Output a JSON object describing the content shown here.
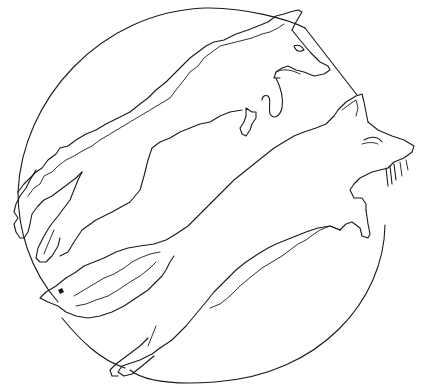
{
  "image": {
    "title": "Two foxes leaping inside a circle",
    "style": "black line art on white (coloring page)",
    "background_color": "#ffffff",
    "line_color": "#1a1a1a",
    "elements": [
      {
        "name": "circle",
        "description": "large circle frame enclosing the foxes"
      },
      {
        "name": "upper-fox",
        "description": "fox leaping to the right, head at top right, bushy tail at lower left"
      },
      {
        "name": "lower-fox",
        "description": "fox leaping to the right below the first, head pointing up-right with whiskers, tail at lower left"
      }
    ]
  }
}
